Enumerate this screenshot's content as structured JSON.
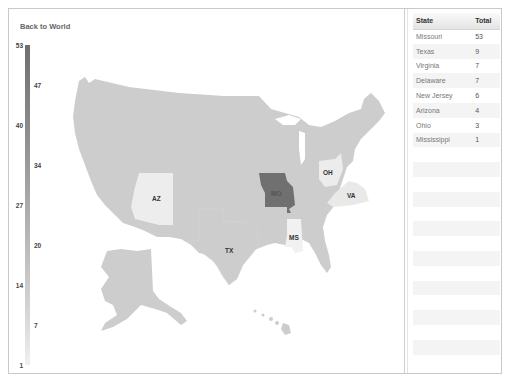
{
  "nav": {
    "back_label": "Back to World"
  },
  "legend": {
    "min": 1,
    "max": 53,
    "color_low": "#f0f0f0",
    "color_high": "#6f6f6f",
    "ticks_left": [
      "53",
      "40",
      "27",
      "14",
      "1"
    ],
    "ticks_right": [
      "47",
      "34",
      "20",
      "7"
    ]
  },
  "map": {
    "base_fill": "#cdcdcd",
    "state_labels": [
      {
        "code": "MO",
        "value": 53,
        "fill": "#707070"
      },
      {
        "code": "TX",
        "value": 9,
        "fill": "#cdcdcd"
      },
      {
        "code": "VA",
        "value": 7,
        "fill": "#e9e9e9"
      },
      {
        "code": "OH",
        "value": 3,
        "fill": "#ececec"
      },
      {
        "code": "AZ",
        "value": 4,
        "fill": "#ededed"
      },
      {
        "code": "MS",
        "value": 1,
        "fill": "#f1f1f1"
      }
    ]
  },
  "table": {
    "headers": {
      "state": "State",
      "total": "Total"
    },
    "rows": [
      {
        "state": "Missouri",
        "total": "53"
      },
      {
        "state": "Texas",
        "total": "9"
      },
      {
        "state": "Virginia",
        "total": "7"
      },
      {
        "state": "Delaware",
        "total": "7"
      },
      {
        "state": "New Jersey",
        "total": "6"
      },
      {
        "state": "Arizona",
        "total": "4"
      },
      {
        "state": "Ohio",
        "total": "3"
      },
      {
        "state": "Mississippi",
        "total": "1"
      }
    ]
  }
}
